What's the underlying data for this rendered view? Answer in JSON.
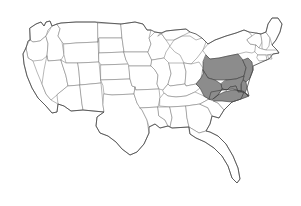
{
  "map": {
    "title": "United States",
    "type": "choropleth-state-map",
    "projection": "albers-usa-approx",
    "background_color": "#ffffff",
    "default_state_fill": "#ffffff",
    "state_border_color": "#7d7d7d",
    "coastline_color": "#4a4a4a",
    "highlight_fill": "#8c8c8c",
    "highlight_border_color": "#3a3a3a",
    "highlighted_region_name": "Mid-Atlantic",
    "highlighted_states": [
      "Pennsylvania",
      "New Jersey",
      "Delaware",
      "Maryland",
      "West Virginia",
      "Virginia"
    ],
    "states": [
      {
        "code": "WA",
        "name": "Washington",
        "highlighted": false,
        "d": "M30,28 L36,24 L41,22 L44,26 L46,22 L50,21 L52,26 L48,30 L46,36 L40,41 L33,42 L30,40 Z"
      },
      {
        "code": "OR",
        "name": "Oregon",
        "highlighted": false,
        "d": "M30,40 L33,42 L40,41 L46,36 L48,44 L47,56 L42,60 L33,61 L28,58 L26,48 Z"
      },
      {
        "code": "CA",
        "name": "California",
        "highlighted": false,
        "d": "M26,48 L28,58 L33,61 L37,72 L42,84 L46,94 L51,100 L58,104 L57,112 L52,113 L46,106 L38,98 L32,88 L27,76 L24,64 L23,54 Z"
      },
      {
        "code": "ID",
        "name": "Idaho",
        "highlighted": false,
        "d": "M46,36 L52,26 L57,24 L60,29 L58,36 L62,42 L64,55 L61,60 L48,61 L47,56 L48,44 Z"
      },
      {
        "code": "NV",
        "name": "Nevada",
        "highlighted": false,
        "d": "M47,56 L48,61 L61,60 L66,76 L68,86 L57,95 L51,100 L46,94 L42,84 L44,70 Z"
      },
      {
        "code": "MT",
        "name": "Montana",
        "highlighted": false,
        "d": "M57,24 L61,23 L76,22 L95,22 L98,23 L98,42 L76,43 L64,44 L62,42 L58,36 L60,29 Z"
      },
      {
        "code": "WY",
        "name": "Wyoming",
        "highlighted": false,
        "d": "M64,44 L76,43 L98,42 L99,62 L78,63 L66,63 L64,55 Z"
      },
      {
        "code": "UT",
        "name": "Utah",
        "highlighted": false,
        "d": "M61,60 L66,63 L78,63 L79,72 L80,85 L68,86 L66,76 Z"
      },
      {
        "code": "CO",
        "name": "Colorado",
        "highlighted": false,
        "d": "M78,63 L99,62 L101,83 L80,85 L79,72 Z"
      },
      {
        "code": "AZ",
        "name": "Arizona",
        "highlighted": false,
        "d": "M68,86 L80,85 L82,104 L83,110 L71,111 L64,106 L58,104 L57,95 Z"
      },
      {
        "code": "NM",
        "name": "New Mexico",
        "highlighted": false,
        "d": "M80,85 L101,83 L103,105 L104,112 L83,110 L82,104 Z"
      },
      {
        "code": "ND",
        "name": "North Dakota",
        "highlighted": false,
        "d": "M98,23 L121,24 L122,38 L99,38 L98,42 Z"
      },
      {
        "code": "SD",
        "name": "South Dakota",
        "highlighted": false,
        "d": "M99,38 L122,38 L124,52 L99,53 L99,42 Z"
      },
      {
        "code": "NE",
        "name": "Nebraska",
        "highlighted": false,
        "d": "M99,53 L124,52 L126,60 L129,64 L101,65 L99,62 Z"
      },
      {
        "code": "KS",
        "name": "Kansas",
        "highlighted": false,
        "d": "M101,65 L129,64 L130,79 L101,80 Z"
      },
      {
        "code": "OK",
        "name": "Oklahoma",
        "highlighted": false,
        "d": "M101,80 L130,79 L132,86 L135,87 L134,94 L112,95 L104,94 L103,86 Z"
      },
      {
        "code": "TX",
        "name": "Texas",
        "highlighted": false,
        "d": "M104,94 L112,95 L134,94 L137,103 L142,110 L147,120 L149,133 L144,144 L137,152 L130,155 L122,149 L116,142 L108,136 L100,133 L96,126 L97,117 L104,112 L103,105 Z"
      },
      {
        "code": "MN",
        "name": "Minnesota",
        "highlighted": false,
        "d": "M121,24 L135,22 L143,24 L147,30 L151,30 L149,38 L151,44 L148,52 L126,52 L124,52 L122,38 Z"
      },
      {
        "code": "IA",
        "name": "Iowa",
        "highlighted": false,
        "d": "M124,52 L148,52 L152,60 L151,66 L129,66 L126,60 Z"
      },
      {
        "code": "MO",
        "name": "Missouri",
        "highlighted": false,
        "d": "M129,66 L151,66 L155,70 L158,75 L157,84 L159,89 L136,90 L135,87 L132,86 L130,79 Z"
      },
      {
        "code": "AR",
        "name": "Arkansas",
        "highlighted": false,
        "d": "M136,90 L159,89 L160,98 L158,107 L140,108 L137,103 L134,94 L135,87 Z"
      },
      {
        "code": "LA",
        "name": "Louisiana",
        "highlighted": false,
        "d": "M140,108 L158,107 L159,116 L165,120 L168,126 L160,128 L155,124 L149,127 L147,120 L142,110 Z"
      },
      {
        "code": "WI",
        "name": "Wisconsin",
        "highlighted": false,
        "d": "M148,52 L151,44 L149,38 L155,32 L161,33 L166,40 L170,46 L166,52 L164,58 L152,60 Z"
      },
      {
        "code": "IL",
        "name": "Illinois",
        "highlighted": false,
        "d": "M152,60 L164,58 L169,63 L171,74 L168,84 L163,90 L159,89 L157,84 L158,75 L155,70 L151,66 Z"
      },
      {
        "code": "MI",
        "name": "Michigan",
        "highlighted": false,
        "d": "M170,46 L174,40 L182,36 L190,36 L196,40 L202,38 L206,42 L203,50 L197,58 L191,64 L184,63 L180,55 L175,52 Z M158,36 L166,31 L175,30 L186,29 L190,32 L182,36 L174,40 L166,40 L161,33 Z"
      },
      {
        "code": "IN",
        "name": "Indiana",
        "highlighted": false,
        "d": "M169,63 L184,63 L186,72 L185,84 L170,86 L168,84 L171,74 Z"
      },
      {
        "code": "OH",
        "name": "Ohio",
        "highlighted": false,
        "d": "M184,63 L191,64 L199,62 L203,68 L201,78 L196,84 L186,86 L185,84 L186,72 Z"
      },
      {
        "code": "KY",
        "name": "Kentucky",
        "highlighted": false,
        "d": "M163,90 L168,84 L170,86 L185,84 L186,86 L196,84 L200,88 L195,92 L186,96 L176,97 L168,96 L164,93 Z"
      },
      {
        "code": "TN",
        "name": "Tennessee",
        "highlighted": false,
        "d": "M160,98 L164,93 L168,96 L176,97 L186,96 L195,92 L204,96 L209,99 L200,104 L186,106 L170,107 L160,106 Z"
      },
      {
        "code": "MS",
        "name": "Mississippi",
        "highlighted": false,
        "d": "M158,107 L170,107 L172,118 L170,127 L168,126 L165,120 L159,116 Z"
      },
      {
        "code": "AL",
        "name": "Alabama",
        "highlighted": false,
        "d": "M170,107 L186,106 L187,118 L189,127 L172,128 L170,127 L172,118 Z"
      },
      {
        "code": "GA",
        "name": "Georgia",
        "highlighted": false,
        "d": "M186,106 L200,104 L208,108 L212,116 L210,124 L206,131 L199,133 L189,127 L187,118 Z"
      },
      {
        "code": "FL",
        "name": "Florida",
        "highlighted": false,
        "d": "M189,127 L199,133 L206,131 L210,132 L218,136 L226,144 L233,156 L238,168 L240,179 L237,183 L232,178 L228,166 L222,156 L214,148 L205,142 L196,138 L190,134 Z"
      },
      {
        "code": "SC",
        "name": "South Carolina",
        "highlighted": false,
        "d": "M200,104 L209,99 L218,103 L224,110 L219,118 L212,116 L208,108 Z"
      },
      {
        "code": "NC",
        "name": "North Carolina",
        "highlighted": false,
        "d": "M204,96 L211,92 L222,90 L233,89 L244,92 L249,96 L241,99 L232,102 L224,110 L218,103 L209,99 Z"
      },
      {
        "code": "NY",
        "name": "New York",
        "highlighted": false,
        "d": "M203,50 L208,44 L215,40 L226,36 L236,33 L244,30 L249,32 L252,36 L247,40 L250,44 L256,45 L258,50 L252,53 L246,52 L238,54 L228,56 L219,58 L210,59 L206,55 Z"
      },
      {
        "code": "PA",
        "name": "Pennsylvania",
        "highlighted": true,
        "d": "M206,55 L210,59 L219,58 L228,56 L238,54 L243,60 L246,68 L244,76 L236,79 L226,80 L215,80 L208,78 L203,70 L203,62 Z"
      },
      {
        "code": "NJ",
        "name": "New Jersey",
        "highlighted": true,
        "d": "M243,60 L248,58 L252,62 L253,70 L250,78 L246,82 L243,80 L244,76 L246,68 Z"
      },
      {
        "code": "DE",
        "name": "Delaware",
        "highlighted": true,
        "d": "M243,80 L246,82 L247,88 L245,93 L241,92 L241,84 Z"
      },
      {
        "code": "MD",
        "name": "Maryland",
        "highlighted": true,
        "d": "M226,80 L236,79 L244,76 L243,80 L241,84 L241,92 L238,92 L236,86 L230,87 L227,90 L222,89 L221,84 Z"
      },
      {
        "code": "WV",
        "name": "West Virginia",
        "highlighted": true,
        "d": "M203,70 L208,78 L215,80 L221,84 L222,89 L218,95 L213,99 L209,99 L204,96 L200,88 L196,84 L201,78 L203,74 Z"
      },
      {
        "code": "VA",
        "name": "Virginia",
        "highlighted": true,
        "d": "M213,99 L218,95 L222,89 L227,90 L230,87 L236,86 L238,92 L241,92 L245,93 L248,96 L244,92 L233,89 L222,90 L211,92 L209,99 Z M213,99 L218,95 L224,92 L233,90 L243,91 L249,96 L241,99 L232,102 L222,101 L214,101 Z"
      },
      {
        "code": "VT",
        "name": "Vermont",
        "highlighted": false,
        "d": "M252,36 L256,33 L261,34 L262,42 L259,48 L256,45 L250,44 L247,40 Z"
      },
      {
        "code": "NH",
        "name": "New Hampshire",
        "highlighted": false,
        "d": "M261,34 L266,32 L270,38 L269,46 L266,50 L262,49 L262,42 Z"
      },
      {
        "code": "ME",
        "name": "Maine",
        "highlighted": false,
        "d": "M266,32 L268,24 L272,18 L278,18 L282,24 L280,32 L276,40 L272,45 L270,38 Z"
      },
      {
        "code": "MA",
        "name": "Massachusetts",
        "highlighted": false,
        "d": "M256,45 L259,48 L262,49 L266,50 L272,50 L277,50 L279,53 L273,54 L266,55 L258,55 L255,52 Z"
      },
      {
        "code": "RI",
        "name": "Rhode Island",
        "highlighted": false,
        "d": "M268,55 L271,55 L272,59 L269,59 Z"
      },
      {
        "code": "CT",
        "name": "Connecticut",
        "highlighted": false,
        "d": "M258,55 L266,55 L267,60 L259,61 L257,58 Z"
      }
    ],
    "national_outline": "M30,28 L36,24 L41,22 L44,26 L46,22 L50,21 L52,26 L57,24 L61,23 L76,22 L95,22 L121,24 L135,22 L143,24 L147,30 L151,30 L155,32 L161,33 L166,31 L175,30 L186,29 L190,32 L196,34 L202,38 L206,42 L208,44 L215,40 L226,36 L236,33 L244,30 L249,32 L256,33 L261,34 L266,32 L268,24 L272,18 L278,18 L282,24 L280,32 L276,40 L272,45 L277,50 L279,53 L273,54 L269,59 L262,62 L253,66 L253,70 L250,78 L247,88 L249,96 L244,92 L241,99 L232,102 L224,110 L219,118 L212,116 L210,124 L206,131 L210,132 L218,136 L226,144 L233,156 L238,168 L240,179 L237,183 L232,178 L228,166 L222,156 L214,148 L205,142 L196,138 L190,134 L189,127 L172,128 L170,127 L168,126 L160,128 L155,124 L149,127 L149,133 L144,144 L137,152 L130,155 L122,149 L116,142 L108,136 L100,133 L96,126 L97,117 L104,112 L83,110 L71,111 L64,106 L58,104 L57,112 L52,113 L46,106 L38,98 L32,88 L27,76 L24,64 L23,54 L26,48 L28,41 L30,40 Z"
  }
}
